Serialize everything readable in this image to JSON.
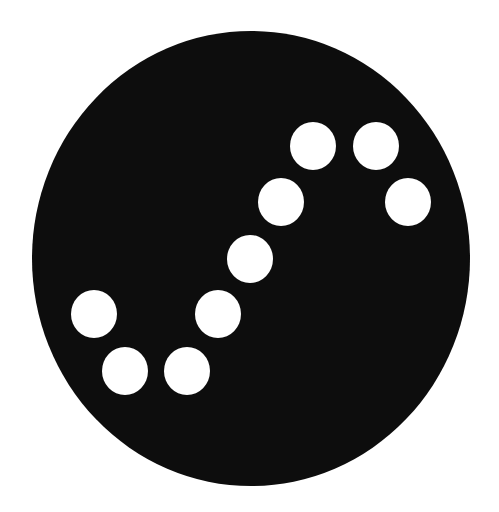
{
  "graphic": {
    "disc": {
      "color": "#0d0d0d",
      "center": [
        251,
        258.5
      ],
      "width": 438,
      "height": 455
    },
    "dot_color": "#ffffff",
    "dot_size": [
      46,
      48
    ],
    "dots": [
      {
        "x": 313,
        "y": 146
      },
      {
        "x": 376,
        "y": 146
      },
      {
        "x": 408,
        "y": 202
      },
      {
        "x": 281,
        "y": 202
      },
      {
        "x": 250,
        "y": 259
      },
      {
        "x": 94,
        "y": 314
      },
      {
        "x": 218,
        "y": 314
      },
      {
        "x": 125,
        "y": 371
      },
      {
        "x": 187,
        "y": 371
      }
    ]
  }
}
